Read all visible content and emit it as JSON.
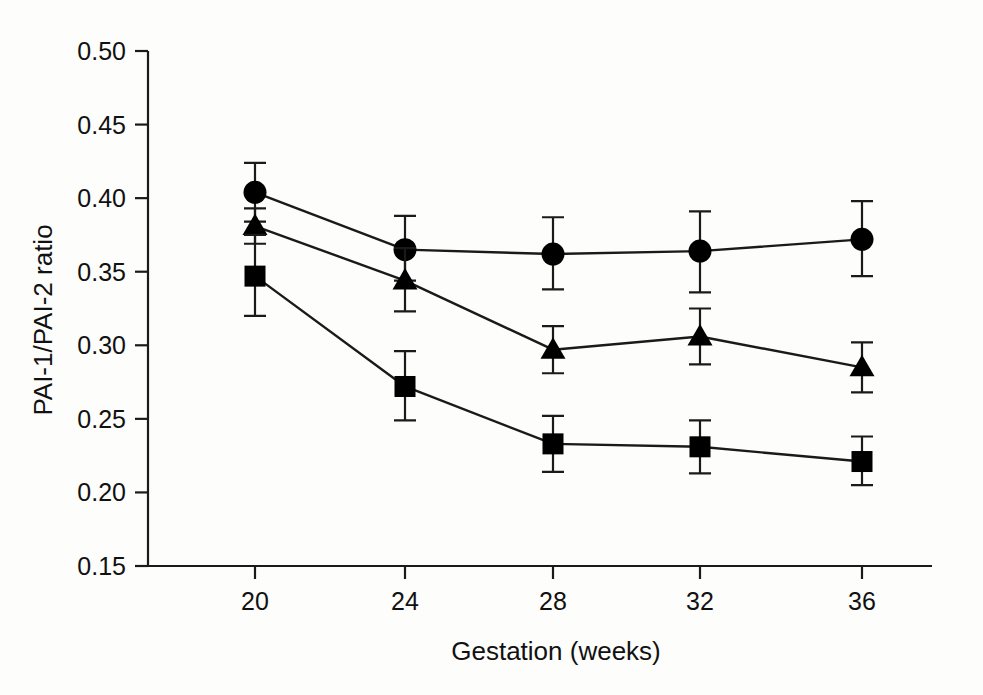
{
  "chart_data": {
    "type": "line",
    "title": "",
    "subtitle": "",
    "xlabel": "Gestation (weeks)",
    "ylabel": "PAI-1/PAI-2 ratio",
    "x": [
      20,
      24,
      28,
      32,
      36
    ],
    "xtick_labels": [
      "20",
      "24",
      "28",
      "32",
      "36"
    ],
    "ytick_labels": [
      "0.15",
      "0.20",
      "0.25",
      "0.30",
      "0.35",
      "0.40",
      "0.45",
      "0.50"
    ],
    "yticks": [
      0.15,
      0.2,
      0.25,
      0.3,
      0.35,
      0.4,
      0.45,
      0.5
    ],
    "xlim": [
      18.4,
      37.9
    ],
    "ylim": [
      0.15,
      0.5
    ],
    "grid": false,
    "legend": "none",
    "error_bars": "vertical, symmetric caps",
    "marker_color": "#000000",
    "line_color": "#000000",
    "background_color": "#ffffff",
    "series": [
      {
        "name": "circle-series",
        "marker": "circle",
        "values": [
          0.404,
          0.365,
          0.362,
          0.364,
          0.372
        ],
        "err_low": [
          0.384,
          0.344,
          0.338,
          0.336,
          0.347
        ],
        "err_high": [
          0.424,
          0.388,
          0.387,
          0.391,
          0.398
        ]
      },
      {
        "name": "triangle-series",
        "marker": "triangle",
        "values": [
          0.381,
          0.344,
          0.297,
          0.306,
          0.285
        ],
        "err_low": [
          0.369,
          0.323,
          0.281,
          0.287,
          0.268
        ],
        "err_high": [
          0.393,
          0.366,
          0.313,
          0.325,
          0.302
        ]
      },
      {
        "name": "square-series",
        "marker": "square",
        "values": [
          0.347,
          0.272,
          0.233,
          0.231,
          0.221
        ],
        "err_low": [
          0.32,
          0.249,
          0.214,
          0.213,
          0.205
        ],
        "err_high": [
          0.375,
          0.296,
          0.252,
          0.249,
          0.238
        ]
      }
    ]
  },
  "axes": {
    "x_title": "Gestation (weeks)",
    "y_title": "PAI-1/PAI-2 ratio"
  },
  "ghost_text": {
    "line1": "",
    "line2": ""
  }
}
